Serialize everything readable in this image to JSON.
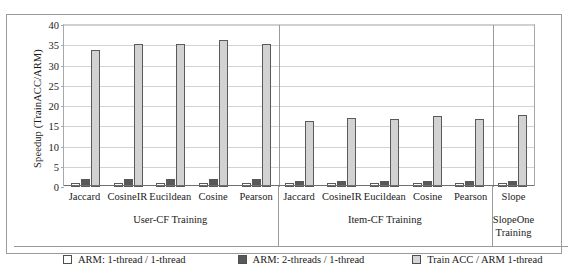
{
  "chart_data": {
    "type": "bar",
    "title": "",
    "xlabel": "",
    "ylabel": "Speedup (TrainACC/ARM)",
    "ylim": [
      0,
      40
    ],
    "yticks": [
      "0",
      "5",
      "10",
      "15",
      "20",
      "25",
      "30",
      "35",
      "40"
    ],
    "grid": true,
    "legend_position": "bottom",
    "categories": [
      "Jaccard",
      "CosineIR",
      "Eucildean",
      "Cosine",
      "Pearson",
      "Jaccard",
      "CosineIR",
      "Eucildean",
      "Cosine",
      "Pearson",
      "Slope"
    ],
    "groups": [
      {
        "label": "User-CF Training",
        "label_lines": [
          "User-CF Training"
        ],
        "count": 5
      },
      {
        "label": "Item-CF Training",
        "label_lines": [
          "Item-CF Training"
        ],
        "count": 5
      },
      {
        "label": "SlopeOne Training",
        "label_lines": [
          "SlopeOne",
          "Training"
        ],
        "count": 1
      }
    ],
    "series": [
      {
        "name": "ARM: 1-thread / 1-thread",
        "color": "#ffffff",
        "values": [
          1.0,
          1.0,
          1.0,
          1.0,
          1.0,
          1.0,
          1.0,
          1.0,
          1.0,
          1.0,
          1.0
        ]
      },
      {
        "name": "ARM: 2-threads / 1-thread",
        "color": "#585858",
        "values": [
          1.9,
          1.9,
          1.9,
          1.9,
          1.9,
          1.6,
          1.6,
          1.6,
          1.6,
          1.6,
          1.6
        ]
      },
      {
        "name": "Train ACC / ARM 1-thread",
        "color": "#d2d2d2",
        "values": [
          33.9,
          35.2,
          35.2,
          36.2,
          35.2,
          16.3,
          17.0,
          16.8,
          17.5,
          16.8,
          17.8
        ]
      }
    ]
  }
}
